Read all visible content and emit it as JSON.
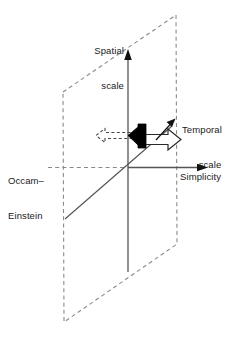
{
  "figure": {
    "type": "3d-axis-diagram"
  },
  "labels": {
    "spatial_scale_line1": "Spatial",
    "spatial_scale_line2": "scale",
    "temporal_scale_line1": "Temporal",
    "temporal_scale_line2": "scale",
    "occam_einstein_line1": "Occam–",
    "occam_einstein_line2": "Einstein",
    "simplicity": "Simplicity"
  },
  "axes": [
    {
      "name": "spatial-scale-axis",
      "label": "Spatial scale",
      "orientation": "vertical",
      "direction": "up",
      "arrowhead": true
    },
    {
      "name": "simplicity-axis",
      "label": "Simplicity",
      "orientation": "horizontal",
      "direction": "right",
      "arrowhead": true
    },
    {
      "name": "temporal-scale-axis",
      "label": "Temporal scale",
      "orientation": "diagonal",
      "direction": "up-right",
      "arrowhead": true
    }
  ],
  "annotations": [
    {
      "name": "occam-einstein-guide",
      "label": "Occam–Einstein",
      "style": "dashed",
      "direction": "left"
    },
    {
      "name": "black-block-arrow",
      "style": "filled-solid",
      "fill": "#000000",
      "direction": "left"
    },
    {
      "name": "white-block-arrow",
      "style": "outlined",
      "fill": "#ffffff",
      "direction": "right"
    },
    {
      "name": "dashed-outline-arrow",
      "style": "dashed-outline",
      "direction": "left"
    },
    {
      "name": "temporal-scale-pointer-arrow",
      "style": "thin-solid",
      "direction": "up-right"
    }
  ],
  "plane": {
    "name": "spatial-temporal-plane",
    "style": "dashed-parallelogram",
    "stroke": "#888888"
  },
  "colors": {
    "background": "#ffffff",
    "axis": "#555555",
    "text": "#1a1a1a",
    "dashed": "#8a8a8a",
    "black_arrow": "#000000",
    "outline": "#3a3a3a"
  }
}
